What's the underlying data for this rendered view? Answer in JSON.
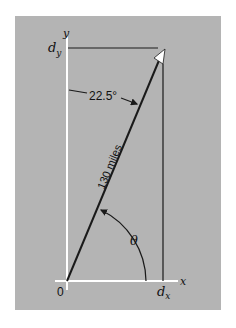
{
  "diagram": {
    "axes": {
      "x_label": "x",
      "y_label": "y",
      "origin_label": "0"
    },
    "components": {
      "dx_label": "d",
      "dx_sub": "x",
      "dy_label": "d",
      "dy_sub": "y"
    },
    "vector": {
      "magnitude_label": "130 miles"
    },
    "angles": {
      "from_y_axis_label": "22.5°",
      "from_x_axis_label": "θ"
    },
    "colors": {
      "panel": "#b4b4b4",
      "axes": "#ffffff",
      "lines": "#1a1a1a"
    }
  }
}
